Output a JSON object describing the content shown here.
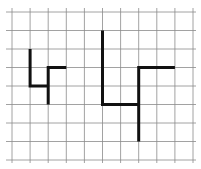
{
  "grid": {
    "origin_x": 12,
    "origin_y": 12,
    "cell_w": 18.1,
    "cell_h": 18.5,
    "cols": 10,
    "rows": 8,
    "line_color": "#8a8a8a",
    "line_width": 0.8
  },
  "shapes": [
    {
      "name": "small-figure",
      "color": "#111111",
      "stroke_width": 3,
      "points": [
        [
          1,
          2
        ],
        [
          1,
          4
        ],
        [
          2,
          4
        ],
        [
          2,
          5
        ],
        [
          2,
          3
        ],
        [
          3,
          3
        ]
      ]
    },
    {
      "name": "large-figure",
      "color": "#111111",
      "stroke_width": 3,
      "points": [
        [
          5,
          1
        ],
        [
          5,
          5
        ],
        [
          7,
          5
        ],
        [
          7,
          7
        ],
        [
          7,
          3
        ],
        [
          9,
          3
        ]
      ]
    }
  ]
}
